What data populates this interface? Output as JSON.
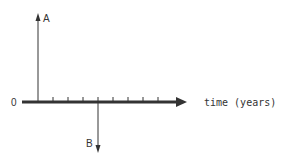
{
  "diagram": {
    "origin_label": "0",
    "axis_label": "time (years)",
    "vectors": [
      {
        "label": "A",
        "direction": "up",
        "tick_index": 1
      },
      {
        "label": "B",
        "direction": "down",
        "tick_index": 5
      }
    ],
    "tick_count": 9
  }
}
